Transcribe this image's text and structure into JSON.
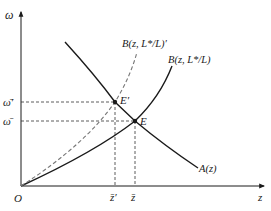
{
  "diagram": {
    "axes": {
      "y_label": "ω",
      "x_label": "z",
      "origin_label": "O"
    },
    "curves": {
      "A": {
        "label": "A(z)",
        "style": "solid"
      },
      "B": {
        "label": "B(z, L*/L)",
        "style": "solid"
      },
      "B_prime": {
        "label": "B(z, L*/L)′",
        "style": "dashed"
      }
    },
    "points": {
      "E": {
        "label": "E"
      },
      "E_prime": {
        "label": "E′"
      }
    },
    "y_ticks": {
      "omega_bar_prime": "ω̄′",
      "omega_bar": "ω̄"
    },
    "x_ticks": {
      "z_bar_prime": "z̄′",
      "z_bar": "z̄"
    },
    "colors": {
      "line": "#1a1a1a",
      "dashed_curve": "#777777",
      "guide": "#333333"
    }
  }
}
